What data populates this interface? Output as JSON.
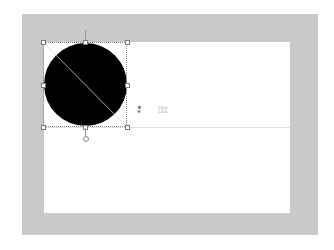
{
  "canvas": {
    "frame_color": "#c9c9c9",
    "artboard_color": "#ffffff"
  },
  "shape": {
    "type": "ellipse",
    "fill": "#000000",
    "selected": true
  },
  "dimensions": {
    "rows": [
      {
        "label": "W",
        "value": "1.15 in"
      },
      {
        "label": "H",
        "value": "1.15 in"
      }
    ]
  }
}
